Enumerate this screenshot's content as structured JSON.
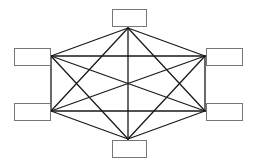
{
  "diagram": {
    "type": "complete-graph",
    "node_count": 6,
    "colors": {
      "edge": "#1a1a1a",
      "node_border": "#777777",
      "node_fill": "#ffffff",
      "background": "#ffffff"
    },
    "nodes": [
      {
        "id": "top",
        "label": "",
        "box": [
          112,
          9,
          34,
          17
        ],
        "anchor": [
          128,
          28
        ]
      },
      {
        "id": "left-upper",
        "label": "",
        "box": [
          14,
          48,
          36,
          17
        ],
        "anchor": [
          51,
          56
        ]
      },
      {
        "id": "right-upper",
        "label": "",
        "box": [
          206,
          48,
          36,
          17
        ],
        "anchor": [
          205,
          56
        ]
      },
      {
        "id": "left-lower",
        "label": "",
        "box": [
          14,
          103,
          36,
          17
        ],
        "anchor": [
          51,
          111
        ]
      },
      {
        "id": "right-lower",
        "label": "",
        "box": [
          206,
          103,
          36,
          17
        ],
        "anchor": [
          205,
          111
        ]
      },
      {
        "id": "bottom",
        "label": "",
        "box": [
          112,
          140,
          34,
          17
        ],
        "anchor": [
          128,
          139
        ]
      }
    ],
    "edges": [
      [
        "top",
        "left-upper"
      ],
      [
        "top",
        "right-upper"
      ],
      [
        "top",
        "left-lower"
      ],
      [
        "top",
        "right-lower"
      ],
      [
        "top",
        "bottom"
      ],
      [
        "left-upper",
        "right-upper"
      ],
      [
        "left-upper",
        "left-lower"
      ],
      [
        "left-upper",
        "right-lower"
      ],
      [
        "left-upper",
        "bottom"
      ],
      [
        "right-upper",
        "left-lower"
      ],
      [
        "right-upper",
        "right-lower"
      ],
      [
        "right-upper",
        "bottom"
      ],
      [
        "left-lower",
        "right-lower"
      ],
      [
        "left-lower",
        "bottom"
      ],
      [
        "right-lower",
        "bottom"
      ]
    ]
  }
}
